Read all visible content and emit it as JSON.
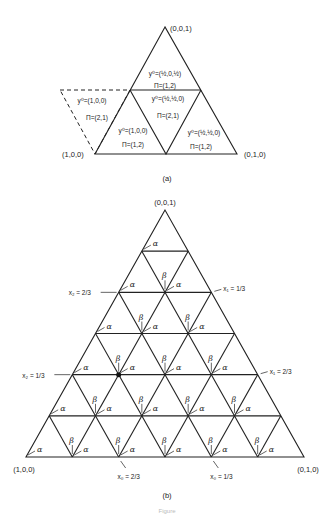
{
  "panel_a": {
    "label": "(a)",
    "vertices": {
      "top": {
        "label": "(0,0,1)",
        "x": 165,
        "y": 27
      },
      "left": {
        "label": "(1,0,0)",
        "x": 95,
        "y": 154
      },
      "right": {
        "label": "(0,1,0)",
        "x": 237,
        "y": 154
      }
    },
    "mid_y": 90,
    "dashed_parallelogram": [
      [
        60,
        90
      ],
      [
        130,
        90
      ],
      [
        95,
        154
      ],
      [
        60,
        90
      ]
    ],
    "cells": [
      {
        "name": "top-cell",
        "y0": "y⁰=(½,0,½)",
        "pi": "Π=(1,2)",
        "y0_x": 165,
        "y0_y": 76,
        "pi_x": 165,
        "pi_y": 88
      },
      {
        "name": "center-cell",
        "y0": "y⁰=(½,½,0)",
        "pi": "Π=(2,1)",
        "y0_x": 168,
        "y0_y": 101,
        "pi_x": 168,
        "pi_y": 118
      },
      {
        "name": "left-cell",
        "y0": "y⁰=(1,0,0)",
        "pi": "Π=(1,2)",
        "y0_x": 133,
        "y0_y": 133,
        "pi_x": 133,
        "pi_y": 147
      },
      {
        "name": "right-cell",
        "y0": "y⁰=(½,½,0)",
        "pi": "Π=(1,2)",
        "y0_x": 204,
        "y0_y": 135,
        "pi_x": 201,
        "pi_y": 149
      },
      {
        "name": "dashed-cell",
        "y0": "y⁰=(1,0,0)",
        "pi": "Π=(2,1)",
        "y0_x": 92,
        "y0_y": 103,
        "pi_x": 97,
        "pi_y": 120
      }
    ]
  },
  "panel_b": {
    "label": "(b)",
    "apex": {
      "x": 165,
      "y": 210
    },
    "base_left": {
      "x": 26,
      "y": 457
    },
    "base_right": {
      "x": 304,
      "y": 457
    },
    "divisions": 6,
    "vertex_labels": {
      "top": "(0,0,1)",
      "left": "(1,0,0)",
      "right": "(0,1,0)"
    },
    "alpha_symbol": "α",
    "beta_symbol": "β",
    "annotations": [
      {
        "text": "x₂ = 2/3",
        "side": "left",
        "row": 2
      },
      {
        "text": "x₂ = 1/3",
        "side": "left",
        "row": 4
      },
      {
        "text": "x₁ = 1/3",
        "side": "right",
        "row": 2
      },
      {
        "text": "x₁ = 2/3",
        "side": "right",
        "row": 4
      },
      {
        "text": "x₀ = 2/3",
        "side": "bottom",
        "index": 2
      },
      {
        "text": "x₀ = 1/3",
        "side": "bottom",
        "index": 4
      }
    ],
    "highlight_vertex": {
      "row": 4,
      "index": 1
    }
  },
  "caption": "Figure"
}
